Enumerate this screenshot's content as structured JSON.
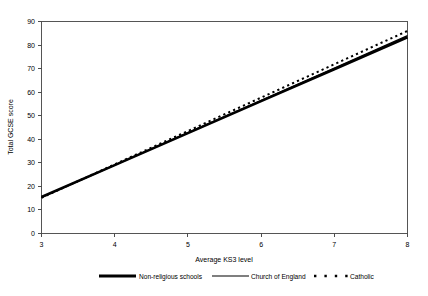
{
  "chart_data": {
    "type": "line",
    "title": "",
    "xlabel": "Average KS3 level",
    "ylabel": "Total GCSE score",
    "xlim": [
      3,
      8
    ],
    "ylim": [
      0,
      90
    ],
    "xticks": [
      "3",
      "4",
      "5",
      "6",
      "7",
      "8"
    ],
    "yticks": [
      "0",
      "10",
      "20",
      "30",
      "40",
      "50",
      "60",
      "70",
      "80",
      "90"
    ],
    "grid": false,
    "legend_position": "bottom",
    "x": [
      3,
      4,
      5,
      6,
      7,
      8
    ],
    "series": [
      {
        "name": "Non-religious schools",
        "style": "solid-thick",
        "color": "#000000",
        "values": [
          15.3,
          28.9,
          42.5,
          56.1,
          69.7,
          83.3
        ]
      },
      {
        "name": "Church of England",
        "style": "solid-thin",
        "color": "#000000",
        "values": [
          15.2,
          28.9,
          42.7,
          56.5,
          70.2,
          84.0
        ]
      },
      {
        "name": "Catholic",
        "style": "dotted",
        "color": "#000000",
        "values": [
          15.0,
          29.2,
          43.4,
          57.6,
          71.8,
          86.0
        ]
      }
    ]
  },
  "axes": {
    "ylabel": "Total GCSE score",
    "xlabel": "Average KS3 level",
    "yticks": [
      "90",
      "80",
      "70",
      "60",
      "50",
      "40",
      "30",
      "20",
      "10",
      "0"
    ],
    "xticks": [
      "3",
      "4",
      "5",
      "6",
      "7",
      "8"
    ]
  },
  "legend": {
    "items": [
      {
        "label": "Non-religious schools",
        "swatch": "solid-thick-line-swatch"
      },
      {
        "label": "Church of England",
        "swatch": "solid-thin-line-swatch"
      },
      {
        "label": "Catholic",
        "swatch": "dotted-line-swatch"
      }
    ]
  }
}
